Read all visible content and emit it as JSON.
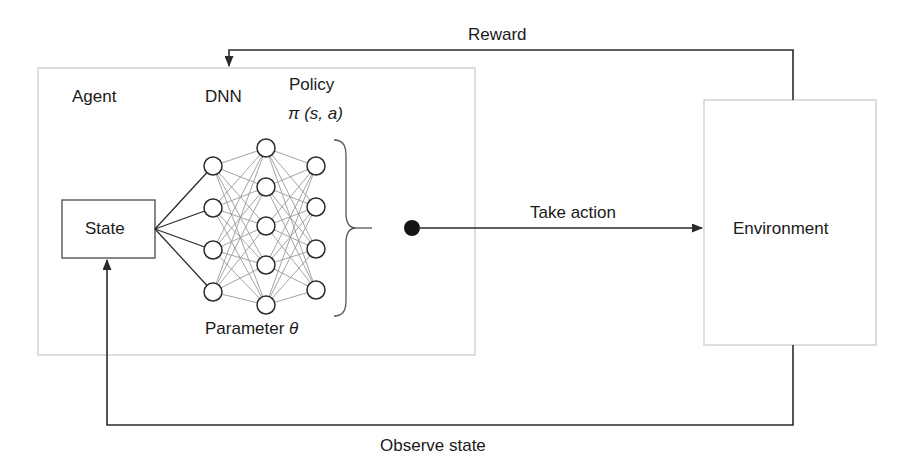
{
  "diagram": {
    "agent": {
      "label": "Agent",
      "state_box_label": "State",
      "dnn_label": "DNN",
      "policy_label": "Policy",
      "policy_function": "π (s, a)",
      "policy_function_symbol": "π",
      "policy_function_args": "(s, a)",
      "parameter_label": "Parameter",
      "parameter_symbol": "θ"
    },
    "environment": {
      "label": "Environment"
    },
    "edges": {
      "reward": "Reward",
      "take_action": "Take action",
      "observe_state": "Observe state"
    },
    "network": {
      "layer_sizes": [
        4,
        5,
        4
      ],
      "layer_x": [
        213,
        266,
        316
      ],
      "node_radius": 9,
      "layer1_y": [
        166,
        208,
        250,
        292
      ],
      "layer2_y": [
        148,
        187,
        226,
        265,
        305
      ],
      "layer3_y": [
        166,
        207,
        249,
        290
      ]
    },
    "colors": {
      "stroke_dark": "#2b2b2b",
      "stroke_light": "#9a9a9a",
      "box_border": "#cfcfcf",
      "node_fill": "#ffffff",
      "background": "#ffffff",
      "text": "#1a1a1a"
    }
  }
}
